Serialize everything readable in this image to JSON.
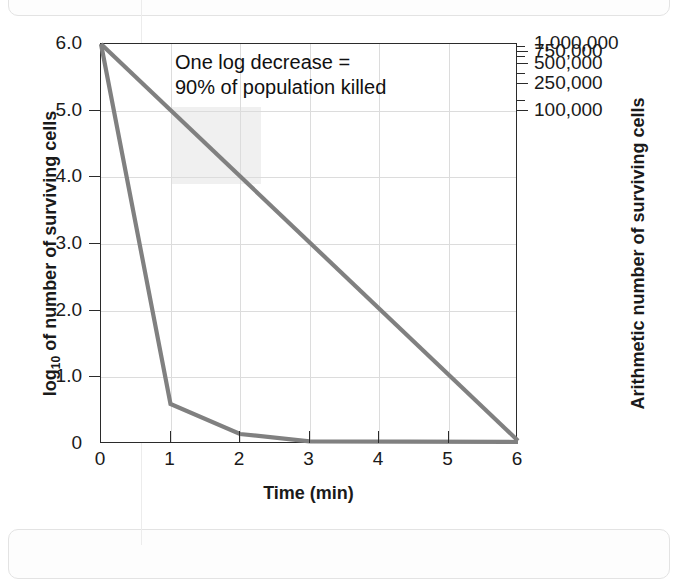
{
  "page": {
    "top_box_text": "(      )                ,                           g",
    "bottom_box_text": ""
  },
  "chart_data": {
    "type": "line",
    "title": "",
    "xlabel": "Time (min)",
    "ylabel": "log10 of number of surviving cells",
    "ylabel_right": "Arithmetic number of surviving cells",
    "xlim": [
      0,
      6
    ],
    "ylim": [
      0,
      6
    ],
    "grid": true,
    "legend": "none",
    "x_ticks": [
      "0",
      "1",
      "2",
      "3",
      "4",
      "5",
      "6"
    ],
    "x_tick_values": [
      0,
      1,
      2,
      3,
      4,
      5,
      6
    ],
    "y_ticks_left": [
      "0",
      "1.0",
      "2.0",
      "3.0",
      "4.0",
      "5.0",
      "6.0"
    ],
    "y_tick_values_left": [
      0,
      1,
      2,
      3,
      4,
      5,
      6
    ],
    "y_ticks_right": [
      "100,000",
      "250,000",
      "500,000",
      "750,000",
      "1,000,000"
    ],
    "y_tick_values_right": [
      100000,
      250000,
      500000,
      750000,
      1000000
    ],
    "y_tick_log_positions_right": [
      5.0,
      5.398,
      5.699,
      5.875,
      6.0
    ],
    "annotations": [
      {
        "text": "One log decrease =\n90% of population killed",
        "x": 1.8,
        "y": 5.75
      }
    ],
    "shaded_region": {
      "x_range": [
        1.0,
        2.3
      ],
      "y_range": [
        3.9,
        5.05
      ],
      "color": "#f0f0f0"
    },
    "series": [
      {
        "name": "Gradual linear decline",
        "color": "#808080",
        "x": [
          0,
          6
        ],
        "values": [
          6.0,
          0.05
        ]
      },
      {
        "name": "Rapid exponential decay",
        "color": "#808080",
        "x": [
          0,
          1,
          2,
          3,
          6
        ],
        "values": [
          6.0,
          0.6,
          0.15,
          0.04,
          0.03
        ]
      }
    ]
  },
  "style": {
    "line_color": "#808080",
    "axis_color": "#2b2b2b",
    "grid_color": "#dcdcdc",
    "background": "#ffffff"
  }
}
